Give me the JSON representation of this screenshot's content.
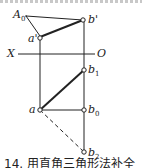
{
  "figure": {
    "caption": "14.  用直角三角形法补全",
    "axis": {
      "left_label": "X",
      "right_label": "O"
    },
    "points": {
      "A0": {
        "label": "A",
        "sub": "0"
      },
      "b_prime": {
        "label": "b'"
      },
      "a_prime": {
        "label": "a'"
      },
      "b1": {
        "label": "b",
        "sub": "1"
      },
      "a": {
        "label": "a"
      },
      "b0": {
        "label": "b",
        "sub": "0"
      },
      "b2": {
        "label": "b",
        "sub": "2"
      }
    },
    "colors": {
      "line": "#222222",
      "border": "#c8c8c8"
    }
  }
}
